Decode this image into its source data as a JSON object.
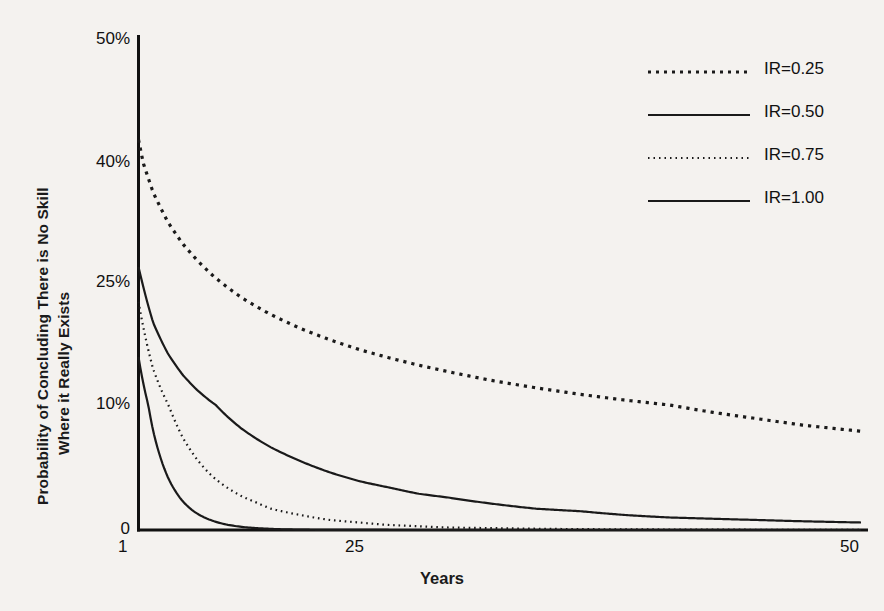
{
  "chart_data": {
    "type": "line",
    "title": "",
    "xlabel": "Years",
    "ylabel_line1": "Probability of Concluding There is No Skill",
    "ylabel_line2": "Where it Really Exists",
    "xlim": [
      1,
      50
    ],
    "ylim": [
      0,
      50
    ],
    "grid": false,
    "legend_position": "upper right",
    "xticks": [
      "1",
      "25",
      "50"
    ],
    "xtick_values": [
      1,
      25,
      50
    ],
    "yticks": [
      "0",
      "10%",
      "25%",
      "40%",
      "50%"
    ],
    "ytick_values": [
      0,
      10,
      25,
      40,
      50
    ],
    "y_axis_note": "Non-linear (compressed) y-axis: tick spacing is uneven between 0, 10%, 25%, 40%, 50%",
    "x": [
      1,
      2,
      3,
      4,
      5,
      6,
      7,
      8,
      9,
      10,
      12,
      14,
      16,
      18,
      20,
      22,
      25,
      28,
      31,
      34,
      37,
      40,
      43,
      46,
      50
    ],
    "series": [
      {
        "name": "IR=0.25",
        "style": "dotted",
        "color": "#1a1a1a",
        "values": [
          41.9,
          36.3,
          32.6,
          29.9,
          27.8,
          26.0,
          24.5,
          23.2,
          22.1,
          21.1,
          19.4,
          18.0,
          16.8,
          15.8,
          14.9,
          14.1,
          13.0,
          12.1,
          11.3,
          10.6,
          10.0,
          9.4,
          8.9,
          8.4,
          7.9
        ]
      },
      {
        "name": "IR=0.50",
        "style": "solid",
        "color": "#1a1a1a",
        "values": [
          27.0,
          20.1,
          16.3,
          13.7,
          11.8,
          10.3,
          9.1,
          8.1,
          7.3,
          6.6,
          5.5,
          4.6,
          3.9,
          3.4,
          2.9,
          2.6,
          2.1,
          1.7,
          1.5,
          1.2,
          1.0,
          0.9,
          0.8,
          0.7,
          0.6
        ]
      },
      {
        "name": "IR=0.75",
        "style": "fine-dotted",
        "color": "#1a1a1a",
        "values": [
          22.7,
          14.4,
          10.1,
          7.4,
          5.6,
          4.3,
          3.4,
          2.7,
          2.2,
          1.7,
          1.2,
          0.8,
          0.6,
          0.4,
          0.3,
          0.2,
          0.15,
          0.1,
          0.07,
          0.05,
          0.04,
          0.03,
          0.02,
          0.02,
          0.01
        ]
      },
      {
        "name": "IR=1.00",
        "style": "solid",
        "color": "#1a1a1a",
        "values": [
          15.9,
          7.9,
          4.2,
          2.3,
          1.3,
          0.75,
          0.43,
          0.25,
          0.15,
          0.09,
          0.03,
          0.01,
          0.005,
          0.002,
          0.001,
          0.0005,
          0.0002,
          0.0001,
          5e-05,
          2e-05,
          1e-05,
          5e-06,
          2e-06,
          1e-06,
          5e-07
        ]
      }
    ]
  },
  "legend": {
    "entries": [
      {
        "label": "IR=0.25",
        "style": "dotted"
      },
      {
        "label": "IR=0.50",
        "style": "solid"
      },
      {
        "label": "IR=0.75",
        "style": "fine-dotted"
      },
      {
        "label": "IR=1.00",
        "style": "solid"
      }
    ]
  },
  "colors": {
    "background": "#f4f2ef",
    "ink": "#1a1a1a",
    "axis": "#111111"
  }
}
